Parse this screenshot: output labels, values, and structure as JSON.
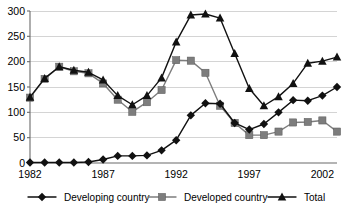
{
  "chart_data": {
    "type": "line",
    "title": "",
    "subtitle": "",
    "xlabel": "",
    "ylabel": "",
    "xlim": [
      1982,
      2003
    ],
    "ylim": [
      0,
      300
    ],
    "yticks": [
      0,
      50,
      100,
      150,
      200,
      250,
      300
    ],
    "ytick_labels": [
      "0",
      "50",
      "100",
      "150",
      "200",
      "250",
      "300"
    ],
    "xticks": [
      1982,
      1987,
      1992,
      1997,
      2002
    ],
    "xtick_labels": [
      "1982",
      "1987",
      "1992",
      "1997",
      "2002"
    ],
    "grid": "horizontal",
    "legend_position": "bottom",
    "x": [
      1982,
      1983,
      1984,
      1985,
      1986,
      1987,
      1988,
      1989,
      1990,
      1991,
      1992,
      1993,
      1994,
      1995,
      1996,
      1997,
      1998,
      1999,
      2000,
      2001,
      2002,
      2003
    ],
    "series": [
      {
        "name": "Developing country",
        "marker": "diamond",
        "color": "#111111",
        "values": [
          1,
          1,
          1,
          1,
          2,
          7,
          14,
          14,
          15,
          25,
          45,
          94,
          118,
          117,
          79,
          66,
          77,
          100,
          124,
          123,
          133,
          150
        ]
      },
      {
        "name": "Developed country",
        "marker": "square",
        "color": "#7d7d7d",
        "values": [
          129,
          166,
          190,
          181,
          177,
          157,
          125,
          101,
          120,
          144,
          203,
          202,
          178,
          113,
          79,
          55,
          55,
          62,
          80,
          81,
          84,
          62
        ]
      },
      {
        "name": "Total",
        "marker": "triangle",
        "color": "#111111",
        "values": [
          130,
          167,
          190,
          183,
          179,
          164,
          133,
          115,
          133,
          168,
          239,
          292,
          294,
          286,
          216,
          147,
          113,
          131,
          157,
          197,
          201,
          209
        ]
      }
    ]
  },
  "legend": {
    "items": [
      {
        "label": "Developing country",
        "marker": "diamond",
        "color": "#111111"
      },
      {
        "label": "Developed country",
        "marker": "square",
        "color": "#7d7d7d"
      },
      {
        "label": "Total",
        "marker": "triangle",
        "color": "#111111"
      }
    ]
  }
}
